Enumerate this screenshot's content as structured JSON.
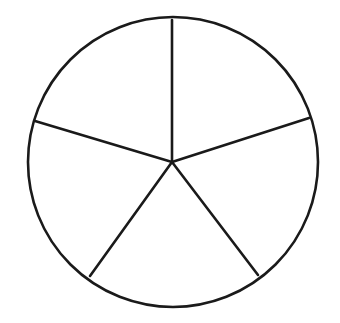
{
  "diagram": {
    "type": "divided-circle",
    "sectors": 5,
    "stroke_color": "#1a1a1a",
    "background": "#ffffff",
    "circle": {
      "cx": 173,
      "cy": 162,
      "r": 145
    },
    "center": {
      "x": 172,
      "y": 162
    },
    "spokes": [
      {
        "x": 172,
        "y": 20
      },
      {
        "x": 309,
        "y": 118
      },
      {
        "x": 258,
        "y": 275
      },
      {
        "x": 90,
        "y": 276
      },
      {
        "x": 35,
        "y": 121
      }
    ]
  }
}
